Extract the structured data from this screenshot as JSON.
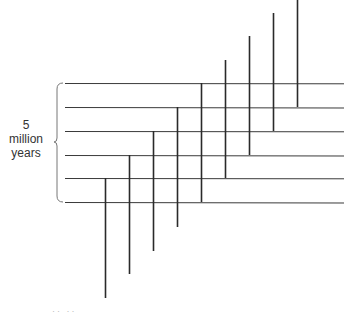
{
  "label": {
    "line1": "5",
    "line2": "million",
    "line3": "years"
  },
  "footer_fragment": "·· ··",
  "colors": {
    "line": "#2a2a2a",
    "hline": "#3a3a3a",
    "brace": "#777777",
    "text": "#333333"
  },
  "horizontal_lines": {
    "x_start": 65,
    "x_end": 344,
    "y": [
      83,
      107,
      131,
      155,
      178,
      202
    ]
  },
  "vertical_lines": [
    {
      "x": 105,
      "y1": 178,
      "y2": 298
    },
    {
      "x": 129,
      "y1": 155,
      "y2": 274
    },
    {
      "x": 153,
      "y1": 131,
      "y2": 251
    },
    {
      "x": 177,
      "y1": 107,
      "y2": 227
    },
    {
      "x": 201,
      "y1": 83,
      "y2": 202
    },
    {
      "x": 225,
      "y1": 60,
      "y2": 178
    },
    {
      "x": 249,
      "y1": 36,
      "y2": 155
    },
    {
      "x": 273,
      "y1": 13,
      "y2": 131
    },
    {
      "x": 297,
      "y1": 0,
      "y2": 107
    }
  ],
  "brace": {
    "x": 57,
    "top": 83,
    "bottom": 202,
    "mid": 142
  }
}
